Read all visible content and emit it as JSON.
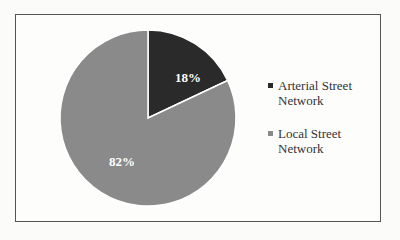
{
  "chart_data": {
    "type": "pie",
    "title": "",
    "categories": [
      "Arterial Street Network",
      "Local Street Network"
    ],
    "values": [
      18,
      82
    ],
    "labels": [
      "18%",
      "82%"
    ],
    "colors": [
      "#2a2a2a",
      "#8a8a8a"
    ],
    "start_angle": "12 o'clock, clockwise",
    "legend_position": "right"
  },
  "legend": {
    "items": [
      {
        "label_line1": "Arterial Street",
        "label_line2": "Network",
        "color": "#2a2a2a"
      },
      {
        "label_line1": "Local Street",
        "label_line2": "Network",
        "color": "#8a8a8a"
      }
    ]
  }
}
